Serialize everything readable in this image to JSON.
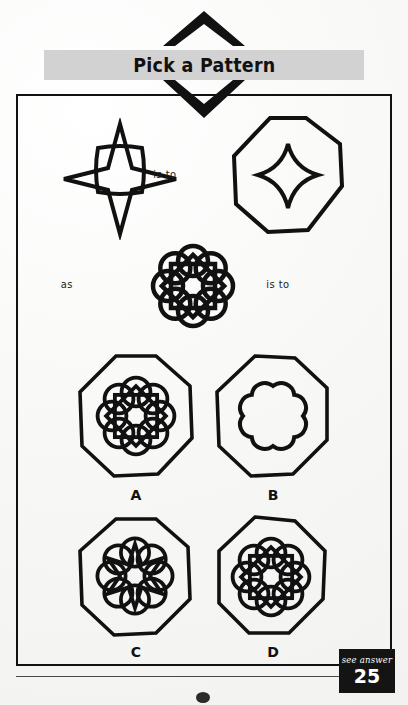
{
  "header": {
    "title": "Pick a Pattern",
    "chevron_up_icon": "chevron-up-icon",
    "chevron_down_icon": "chevron-down-icon"
  },
  "puzzle": {
    "type": "visual-analogy",
    "connectors": {
      "is_to_1": "is to",
      "as": "as",
      "is_to_2": "is to"
    },
    "prompt_figures": [
      {
        "id": "prompt-1",
        "name": "four-pointed-star-with-rounded-square",
        "description": "Four-pointed concave star overlapping a rounded square"
      },
      {
        "id": "prompt-2",
        "name": "octagon-with-concave-star",
        "description": "Octagon containing a small concave four-pointed star"
      },
      {
        "id": "prompt-3",
        "name": "eight-circle-rosette-with-star",
        "description": "Rosette of eight overlapping circles with an eight-pointed star inside"
      }
    ],
    "options": [
      {
        "label": "A",
        "name": "option-a-octagon-rosette-full",
        "description": "Octagon containing the full eight-circle rosette with eight-pointed star"
      },
      {
        "label": "B",
        "name": "option-b-octagon-scallop",
        "description": "Octagon containing only a scalloped flower outline"
      },
      {
        "label": "C",
        "name": "option-c-octagon-rosette-open-center",
        "description": "Octagon with rosette whose star leaves an open center"
      },
      {
        "label": "D",
        "name": "option-d-octagon-rosette-closed-center",
        "description": "Octagon with rosette whose star has a filled octagonal center"
      }
    ]
  },
  "answer_badge": {
    "see_answer": "see answer",
    "number": "25"
  },
  "colors": {
    "ink": "#111111",
    "title_bar": "#d2d2d2",
    "badge_bg": "#141414",
    "badge_text": "#ffffff",
    "paper": "#f7f7f5"
  }
}
